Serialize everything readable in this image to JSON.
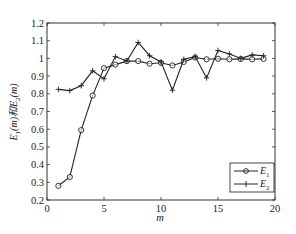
{
  "chart_data": {
    "type": "line",
    "title": "",
    "xlabel": "m",
    "ylabel": "E1(m)和E2(m)",
    "ylabel_parts": {
      "e1": "E",
      "sub1": "1",
      "mid": "(m)和",
      "e2": "E",
      "sub2": "2",
      "end": "(m)"
    },
    "xlim": [
      0,
      20
    ],
    "ylim": [
      0.2,
      1.2
    ],
    "xticks": [
      0,
      5,
      10,
      15,
      20
    ],
    "yticks": [
      0.2,
      0.3,
      0.4,
      0.5,
      0.6,
      0.7,
      0.8,
      0.9,
      1,
      1.1,
      1.2
    ],
    "ytick_labels": [
      "0.2",
      "0.3",
      "0.4",
      "0.5",
      "0.6",
      "0.7",
      "0.8",
      "0.9",
      "1",
      "1.1",
      "1.2"
    ],
    "grid": false,
    "legend_position": "lower right",
    "x": [
      1,
      2,
      3,
      4,
      5,
      6,
      7,
      8,
      9,
      10,
      11,
      12,
      13,
      14,
      15,
      16,
      17,
      18,
      19
    ],
    "series": [
      {
        "name": "E1",
        "label_main": "E",
        "label_sub": "1",
        "marker": "circle",
        "color": "#222222",
        "values": [
          0.28,
          0.33,
          0.595,
          0.79,
          0.945,
          0.965,
          0.985,
          0.985,
          0.97,
          0.975,
          0.96,
          0.98,
          1.005,
          0.995,
          0.998,
          0.995,
          0.997,
          0.995,
          0.997
        ]
      },
      {
        "name": "E2",
        "label_main": "E",
        "label_sub": "2",
        "marker": "plus",
        "color": "#222222",
        "values": [
          0.825,
          0.818,
          0.846,
          0.93,
          0.885,
          1.01,
          0.985,
          1.09,
          1.015,
          0.98,
          0.82,
          0.995,
          1.01,
          0.89,
          1.045,
          1.025,
          1.0,
          1.02,
          1.015
        ]
      }
    ]
  }
}
